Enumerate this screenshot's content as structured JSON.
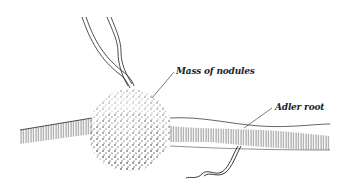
{
  "figure": {
    "type": "botanical line illustration",
    "labels": {
      "nodules": "Mass of nodules",
      "root": "Adler root"
    },
    "colors": {
      "ink": "#222222",
      "background": "#ffffff"
    }
  }
}
